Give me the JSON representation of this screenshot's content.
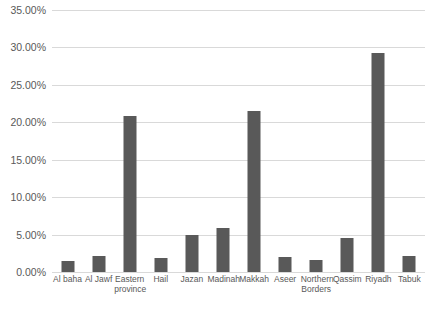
{
  "chart_data": {
    "type": "bar",
    "title": "",
    "xlabel": "",
    "ylabel": "",
    "ylim": [
      0,
      35
    ],
    "y_tick_labels": [
      "35.00%",
      "30.00%",
      "25.00%",
      "20.00%",
      "15.00%",
      "10.00%",
      "5.00%",
      "0.00%"
    ],
    "y_tick_values": [
      35,
      30,
      25,
      20,
      15,
      10,
      5,
      0
    ],
    "grid": true,
    "legend": "none",
    "bar_color": "#595959",
    "gridline_color": "#d9d9d9",
    "categories": [
      "Al baha",
      "Al Jawf",
      "Eastern province",
      "Hail",
      "Jazan",
      "Madinah",
      "Makkah",
      "Aseer",
      "Northern Borders",
      "Qassim",
      "Riyadh",
      "Tabuk"
    ],
    "values": [
      1.5,
      2.2,
      20.9,
      1.9,
      5.0,
      5.9,
      21.5,
      2.0,
      1.6,
      4.5,
      29.3,
      2.1
    ],
    "value_labels": [
      "1.50%",
      "2.20%",
      "20.90%",
      "1.90%",
      "5.00%",
      "5.90%",
      "21.50%",
      "2.00%",
      "1.60%",
      "4.50%",
      "29.30%",
      "2.10%"
    ]
  }
}
